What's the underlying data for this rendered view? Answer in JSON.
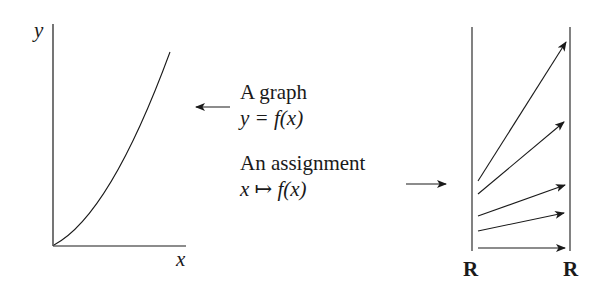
{
  "graph": {
    "y_axis_label": "y",
    "x_axis_label": "x",
    "curve": "increasing convex curve from origin"
  },
  "labels": {
    "graph_title": "A graph",
    "graph_formula": "y = f(x)",
    "assignment_title": "An assignment",
    "assignment_formula": "x ↦ f(x)"
  },
  "mapping": {
    "domain_label": "R",
    "codomain_label": "R",
    "arrow_count": 5
  },
  "colors": {
    "ink": "#1a1a1a",
    "background": "#ffffff"
  }
}
